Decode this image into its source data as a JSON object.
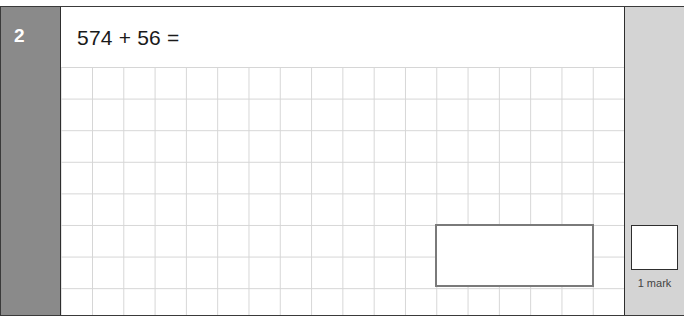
{
  "question": {
    "number": "2",
    "text": "574 + 56 ="
  },
  "answer": {
    "value": ""
  },
  "marks": {
    "label": "1 mark",
    "value": ""
  },
  "colors": {
    "number_panel": "#8a8a8a",
    "mark_panel": "#d4d4d4",
    "answer_border": "#7a7a7a",
    "grid_line": "#d6d6d6"
  }
}
